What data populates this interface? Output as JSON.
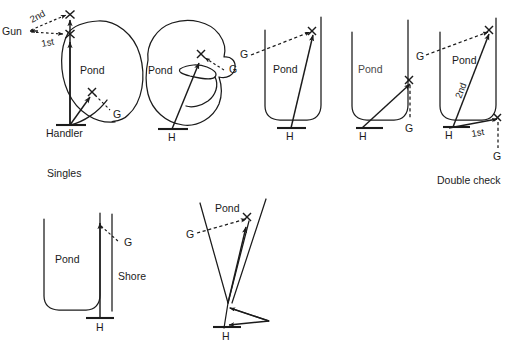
{
  "figure": {
    "title_visible": false,
    "background_color": "#ffffff",
    "ink_color": "#1b1b1b"
  },
  "captions": [
    {
      "id": "singles",
      "text": "Singles",
      "x": 47,
      "y": 177
    },
    {
      "id": "double-check",
      "text": "Double check",
      "x": 437,
      "y": 184
    }
  ],
  "panels": [
    {
      "id": "panel-1-singles",
      "shape": "round-pond",
      "labels": {
        "pond": "Pond",
        "handler": "Handler",
        "gun": "Gun",
        "first": "1st",
        "second": "2nd",
        "guide": "G"
      }
    },
    {
      "id": "panel-2-cove-pond",
      "shape": "irregular-pond-with-cove",
      "labels": {
        "pond": "Pond",
        "handler": "H",
        "guide": "G"
      }
    },
    {
      "id": "panel-3-channel",
      "shape": "u-channel",
      "labels": {
        "pond": "Pond",
        "handler": "H",
        "guide": "G"
      }
    },
    {
      "id": "panel-4-channel-corner",
      "shape": "u-channel",
      "labels": {
        "pond": "Pond",
        "handler": "H",
        "guide": "G"
      }
    },
    {
      "id": "panel-5-double-check",
      "shape": "u-channel",
      "labels": {
        "pond": "Pond",
        "handler": "H",
        "guide_upper": "G",
        "guide_lower": "G",
        "first": "1st",
        "second": "2nd"
      }
    },
    {
      "id": "panel-6-shore",
      "shape": "u-channel-with-shore",
      "labels": {
        "pond": "Pond",
        "shore": "Shore",
        "handler": "H",
        "guide": "G"
      }
    },
    {
      "id": "panel-7-narrow-point",
      "shape": "converging-banks",
      "labels": {
        "pond": "Pond",
        "handler": "H",
        "guide": "G"
      }
    }
  ]
}
